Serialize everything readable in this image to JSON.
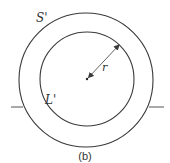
{
  "diagram": {
    "caption": "(b)",
    "colors": {
      "stroke": "#3a3a3a",
      "background": "#ffffff"
    },
    "outer_circle": {
      "label": "S'",
      "cx": 86,
      "cy": 80,
      "r": 67
    },
    "inner_circle": {
      "label": "L'",
      "cx": 87,
      "cy": 79,
      "r": 47
    },
    "radius_arrow": {
      "label": "r",
      "from": [
        87,
        79
      ],
      "to": [
        119,
        45
      ]
    },
    "center_point": {
      "x": 87,
      "y": 79
    },
    "leads": [
      {
        "side": "left",
        "x1": 11,
        "x2": 23,
        "y": 107
      },
      {
        "side": "right",
        "x1": 149,
        "x2": 164,
        "y": 107
      }
    ]
  }
}
